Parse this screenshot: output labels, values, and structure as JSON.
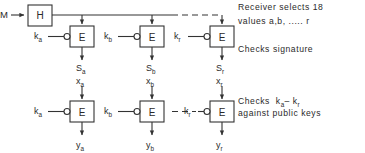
{
  "figure": {
    "type": "block-diagram",
    "background_color": "#ffffff",
    "line_color": "#333333",
    "text_color": "#2a2a2a"
  },
  "input": {
    "message_label": "M",
    "hash_block_label": "H"
  },
  "signature_row": {
    "columns": [
      {
        "key_label": "k",
        "key_sub": "a",
        "block_label": "E",
        "output_label": "S",
        "output_sub": "a"
      },
      {
        "key_label": "k",
        "key_sub": "b",
        "block_label": "E",
        "output_label": "S",
        "output_sub": "b"
      },
      {
        "key_label": "k",
        "key_sub": "r",
        "block_label": "E",
        "output_label": "S",
        "output_sub": "r"
      }
    ],
    "continuation_marker": "dashed"
  },
  "verification_row": {
    "columns": [
      {
        "input_label": "x",
        "input_sub": "a",
        "key_label": "k",
        "key_sub": "a",
        "block_label": "E",
        "output_label": "y",
        "output_sub": "a"
      },
      {
        "input_label": "x",
        "input_sub": "b",
        "key_label": "k",
        "key_sub": "b",
        "block_label": "E",
        "output_label": "y",
        "output_sub": "b"
      },
      {
        "input_label": "x",
        "input_sub": "r",
        "key_label": "k",
        "key_sub": "r",
        "block_label": "E",
        "output_label": "y",
        "output_sub": "r"
      }
    ],
    "continuation_marker": "dashed"
  },
  "annotations": {
    "receiver_line_1": "Receiver selects 18",
    "receiver_line_2": "values a,b, ..... r",
    "checks_signature": "Checks  signature",
    "checks_keys_line_1_prefix": "Checks",
    "checks_keys_line_1_expr": "k",
    "checks_keys_line_1_sub_a": "a",
    "checks_keys_line_1_dash": "–",
    "checks_keys_line_1_expr2": "k",
    "checks_keys_line_1_sub_r": "r",
    "checks_keys_line_2": "against  public  keys"
  }
}
